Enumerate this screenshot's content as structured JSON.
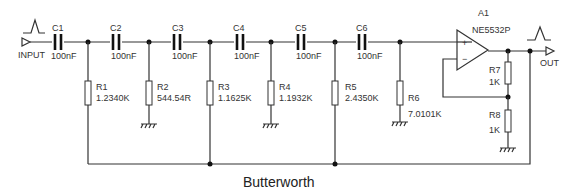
{
  "title": "Butterworth",
  "input": {
    "label": "INPUT"
  },
  "output": {
    "label": "OUT"
  },
  "opamp": {
    "ref": "A1",
    "part": "NE5532P",
    "plus": "+",
    "minus": "−"
  },
  "capacitors": [
    {
      "ref": "C1",
      "value": "100nF"
    },
    {
      "ref": "C2",
      "value": "100nF"
    },
    {
      "ref": "C3",
      "value": "100nF"
    },
    {
      "ref": "C4",
      "value": "100nF"
    },
    {
      "ref": "C5",
      "value": "100nF"
    },
    {
      "ref": "C6",
      "value": "100nF"
    }
  ],
  "resistors": [
    {
      "ref": "R1",
      "value": "1.2340K"
    },
    {
      "ref": "R2",
      "value": "544.54R"
    },
    {
      "ref": "R3",
      "value": "1.1625K"
    },
    {
      "ref": "R4",
      "value": "1.1932K"
    },
    {
      "ref": "R5",
      "value": "2.4350K"
    },
    {
      "ref": "R6",
      "value": "7.0101K"
    },
    {
      "ref": "R7",
      "value": "1K"
    },
    {
      "ref": "R8",
      "value": "1K"
    }
  ]
}
